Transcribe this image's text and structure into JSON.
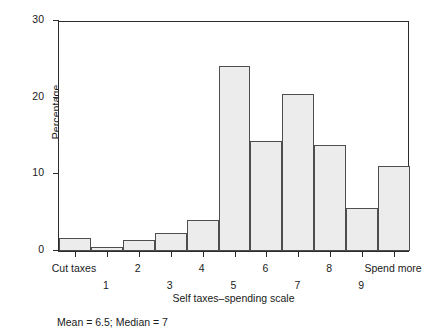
{
  "chart_data": {
    "type": "bar",
    "title": "",
    "xlabel": "Self taxes–spending scale",
    "ylabel": "Percentage",
    "categories": [
      "Cut taxes",
      "1",
      "2",
      "3",
      "4",
      "5",
      "6",
      "7",
      "8",
      "9",
      "Spend more"
    ],
    "values": [
      1.7,
      0.5,
      1.4,
      2.3,
      4.0,
      24.0,
      14.3,
      20.4,
      13.8,
      5.6,
      11.1
    ],
    "ylim": [
      0,
      30
    ],
    "yticks": [
      0,
      10,
      20,
      30
    ],
    "ytick_labels": [
      "0",
      "10",
      "20",
      "30"
    ],
    "grid": false,
    "legend": null,
    "annotations": [
      "Mean = 6.5; Median = 7"
    ],
    "bar_fill_color": "#ececec",
    "bar_border_color": "#4e4e4e",
    "axis_color": "#2b2b2b"
  },
  "footnote": {
    "text": "Mean = 6.5; Median = 7"
  }
}
